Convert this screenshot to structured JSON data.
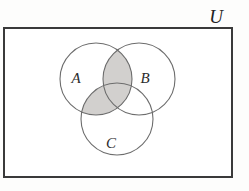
{
  "figure": {
    "kind": "venn-diagram",
    "background_color": "#fdfdfc"
  },
  "universe": {
    "label": "U",
    "label_position": {
      "x": 216,
      "y": 19
    },
    "rect": {
      "x": 4,
      "y": 28,
      "width": 228,
      "height": 149
    },
    "stroke_color": "#3a3a3a",
    "stroke_width": 2,
    "fill_color": "#ffffff"
  },
  "sets": [
    {
      "name": "A",
      "label": "A",
      "cx": 96,
      "cy": 79,
      "r": 36,
      "label_position": {
        "x": 76,
        "y": 80
      },
      "stroke_color": "#6d6d6d",
      "stroke_width": 1.1
    },
    {
      "name": "B",
      "label": "B",
      "cx": 139,
      "cy": 79,
      "r": 36,
      "label_position": {
        "x": 145,
        "y": 80
      },
      "stroke_color": "#6d6d6d",
      "stroke_width": 1.1
    },
    {
      "name": "C",
      "label": "C",
      "cx": 117,
      "cy": 119,
      "r": 36,
      "label_position": {
        "x": 111,
        "y": 145
      },
      "stroke_color": "#6d6d6d",
      "stroke_width": 1.1
    }
  ],
  "shading": {
    "fill_color": "#d2d0ce",
    "description": "A intersect (B union C)",
    "shaded_regions": [
      "A and B only",
      "A and B and C",
      "A and C only"
    ],
    "unshaded_regions": [
      "A only",
      "B only",
      "C only",
      "B and C only",
      "outside all sets"
    ]
  }
}
